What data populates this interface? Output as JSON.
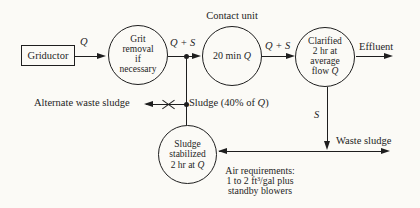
{
  "colors": {
    "ink": "#1e1e1e",
    "paper": "#fbfaf6"
  },
  "diagram": {
    "griductor": {
      "label": "Griductor"
    },
    "flow_q_label": "Q",
    "grit_removal": {
      "lines": [
        "Grit",
        "removal",
        "if",
        "necessary"
      ]
    },
    "q_plus_s_left": "Q + S",
    "contact_unit": {
      "title": "Contact unit",
      "label_pre": "20 min ",
      "label_var": "Q"
    },
    "q_plus_s_right": "Q + S",
    "clarified": {
      "line1": "Clarified",
      "line2": "2 hr at",
      "line3": "average",
      "line4_pre": "flow ",
      "line4_var": "Q"
    },
    "effluent_label": "Effluent",
    "alternate_waste_sludge_label": "Alternate waste sludge",
    "sludge_branch": {
      "pre": "Sludge (40% of ",
      "var": "Q",
      "post": ")"
    },
    "s_label": "S",
    "waste_sludge_label": "Waste sludge",
    "sludge_stabilized": {
      "line1": "Sludge",
      "line2": "stabilized",
      "line3_pre": "2 hr at ",
      "line3_var": "Q"
    },
    "air_requirements": {
      "line1": "Air requirements:",
      "line2": "1 to 2 ft³/gal plus",
      "line3": "standby blowers"
    }
  }
}
